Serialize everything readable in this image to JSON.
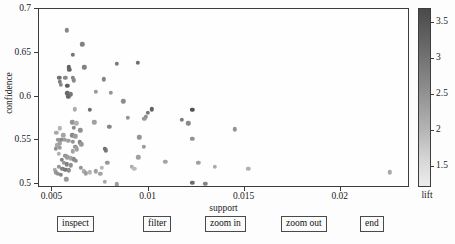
{
  "axes": {
    "x_title": "support",
    "y_title": "confidence",
    "x_ticks": [
      "0.005",
      "0.01",
      "0.015",
      "0.02"
    ],
    "x_tick_values": [
      0.005,
      0.01,
      0.015,
      0.02
    ],
    "y_ticks": [
      "0.5",
      "0.55",
      "0.6",
      "0.65",
      "0.7"
    ],
    "y_tick_values": [
      0.5,
      0.55,
      0.6,
      0.65,
      0.7
    ]
  },
  "colorbar": {
    "title": "lift",
    "ticks": [
      "3.5",
      "3",
      "2.5",
      "2",
      "1.5"
    ],
    "tick_values": [
      3.5,
      3,
      2.5,
      2,
      1.5
    ],
    "min_color": "#ececec",
    "max_color": "#4a4a4a"
  },
  "buttons": [
    {
      "label": "inspect",
      "x": 57
    },
    {
      "label": "filter",
      "x": 143
    },
    {
      "label": "zoom in",
      "x": 205
    },
    {
      "label": "zoom out",
      "x": 281
    },
    {
      "label": "end",
      "x": 360
    }
  ],
  "chart_data": {
    "type": "scatter",
    "title": "",
    "xlabel": "support",
    "ylabel": "confidence",
    "collabel": "lift",
    "xlim": [
      0.0043,
      0.0236
    ],
    "ylim": [
      0.4955,
      0.7
    ],
    "clim": [
      1.2,
      3.7
    ],
    "grid": false,
    "legend": "none",
    "marker": "circle",
    "colormap": "gray-reversed",
    "points": [
      {
        "x": 0.00575,
        "y": 0.6755,
        "lift": 2.55
      },
      {
        "x": 0.00655,
        "y": 0.6595,
        "lift": 2.6
      },
      {
        "x": 0.00605,
        "y": 0.6475,
        "lift": 2.75
      },
      {
        "x": 0.00835,
        "y": 0.6375,
        "lift": 2.7
      },
      {
        "x": 0.00945,
        "y": 0.6385,
        "lift": 2.85
      },
      {
        "x": 0.00585,
        "y": 0.6335,
        "lift": 3.0
      },
      {
        "x": 0.00587,
        "y": 0.6305,
        "lift": 2.95
      },
      {
        "x": 0.00665,
        "y": 0.6335,
        "lift": 2.6
      },
      {
        "x": 0.00535,
        "y": 0.6215,
        "lift": 2.8
      },
      {
        "x": 0.00538,
        "y": 0.6165,
        "lift": 2.65
      },
      {
        "x": 0.00545,
        "y": 0.6135,
        "lift": 2.5
      },
      {
        "x": 0.00567,
        "y": 0.6215,
        "lift": 2.5
      },
      {
        "x": 0.00605,
        "y": 0.6215,
        "lift": 2.6
      },
      {
        "x": 0.00612,
        "y": 0.6185,
        "lift": 2.5
      },
      {
        "x": 0.00578,
        "y": 0.6125,
        "lift": 3.05
      },
      {
        "x": 0.00578,
        "y": 0.6035,
        "lift": 2.9
      },
      {
        "x": 0.00595,
        "y": 0.6025,
        "lift": 2.7
      },
      {
        "x": 0.00583,
        "y": 0.5995,
        "lift": 2.9
      },
      {
        "x": 0.00767,
        "y": 0.6195,
        "lift": 2.55
      },
      {
        "x": 0.00725,
        "y": 0.6055,
        "lift": 2.3
      },
      {
        "x": 0.00805,
        "y": 0.6045,
        "lift": 2.35
      },
      {
        "x": 0.00868,
        "y": 0.5945,
        "lift": 2.45
      },
      {
        "x": 0.00617,
        "y": 0.5855,
        "lift": 2.05
      },
      {
        "x": 0.00694,
        "y": 0.5845,
        "lift": 2.85
      },
      {
        "x": 0.01018,
        "y": 0.5855,
        "lift": 3.0
      },
      {
        "x": 0.01228,
        "y": 0.5845,
        "lift": 3.2
      },
      {
        "x": 0.00995,
        "y": 0.5815,
        "lift": 2.7
      },
      {
        "x": 0.00985,
        "y": 0.5765,
        "lift": 2.45
      },
      {
        "x": 0.00893,
        "y": 0.5755,
        "lift": 2.35
      },
      {
        "x": 0.01172,
        "y": 0.5735,
        "lift": 2.65
      },
      {
        "x": 0.01207,
        "y": 0.5695,
        "lift": 2.5
      },
      {
        "x": 0.00977,
        "y": 0.5745,
        "lift": 2.3
      },
      {
        "x": 0.00604,
        "y": 0.5705,
        "lift": 2.35
      },
      {
        "x": 0.00625,
        "y": 0.5695,
        "lift": 2.0
      },
      {
        "x": 0.00718,
        "y": 0.5705,
        "lift": 2.2
      },
      {
        "x": 0.00538,
        "y": 0.5635,
        "lift": 1.95
      },
      {
        "x": 0.00612,
        "y": 0.5645,
        "lift": 2.45
      },
      {
        "x": 0.00521,
        "y": 0.5585,
        "lift": 2.1
      },
      {
        "x": 0.00795,
        "y": 0.5655,
        "lift": 2.55
      },
      {
        "x": 0.01448,
        "y": 0.5625,
        "lift": 2.35
      },
      {
        "x": 0.00556,
        "y": 0.5555,
        "lift": 2.15
      },
      {
        "x": 0.00603,
        "y": 0.5555,
        "lift": 2.5
      },
      {
        "x": 0.00618,
        "y": 0.5545,
        "lift": 2.25
      },
      {
        "x": 0.00528,
        "y": 0.5505,
        "lift": 2.3
      },
      {
        "x": 0.00546,
        "y": 0.5505,
        "lift": 2.45
      },
      {
        "x": 0.00563,
        "y": 0.5505,
        "lift": 2.25
      },
      {
        "x": 0.00582,
        "y": 0.5495,
        "lift": 2.2
      },
      {
        "x": 0.00607,
        "y": 0.5485,
        "lift": 2.35
      },
      {
        "x": 0.00643,
        "y": 0.5475,
        "lift": 2.6
      },
      {
        "x": 0.00651,
        "y": 0.5455,
        "lift": 2.3
      },
      {
        "x": 0.00525,
        "y": 0.5445,
        "lift": 2.1
      },
      {
        "x": 0.00519,
        "y": 0.5405,
        "lift": 2.4
      },
      {
        "x": 0.00538,
        "y": 0.5415,
        "lift": 2.25
      },
      {
        "x": 0.00619,
        "y": 0.5425,
        "lift": 2.3
      },
      {
        "x": 0.00628,
        "y": 0.5395,
        "lift": 2.2
      },
      {
        "x": 0.00772,
        "y": 0.5405,
        "lift": 2.9
      },
      {
        "x": 0.00778,
        "y": 0.5385,
        "lift": 2.75
      },
      {
        "x": 0.01228,
        "y": 0.5515,
        "lift": 2.4
      },
      {
        "x": 0.00952,
        "y": 0.5535,
        "lift": 2.35
      },
      {
        "x": 0.00975,
        "y": 0.5425,
        "lift": 2.3
      },
      {
        "x": 0.00605,
        "y": 0.5375,
        "lift": 2.15
      },
      {
        "x": 0.00532,
        "y": 0.5345,
        "lift": 2.0
      },
      {
        "x": 0.00567,
        "y": 0.5325,
        "lift": 2.35
      },
      {
        "x": 0.00578,
        "y": 0.5305,
        "lift": 2.25
      },
      {
        "x": 0.00596,
        "y": 0.5295,
        "lift": 2.15
      },
      {
        "x": 0.00612,
        "y": 0.5285,
        "lift": 2.5
      },
      {
        "x": 0.00623,
        "y": 0.5265,
        "lift": 2.45
      },
      {
        "x": 0.00548,
        "y": 0.5275,
        "lift": 2.55
      },
      {
        "x": 0.00558,
        "y": 0.5245,
        "lift": 2.3
      },
      {
        "x": 0.00575,
        "y": 0.5225,
        "lift": 2.6
      },
      {
        "x": 0.00594,
        "y": 0.5215,
        "lift": 2.4
      },
      {
        "x": 0.00534,
        "y": 0.5195,
        "lift": 2.35
      },
      {
        "x": 0.00552,
        "y": 0.5175,
        "lift": 2.55
      },
      {
        "x": 0.00566,
        "y": 0.5165,
        "lift": 2.7
      },
      {
        "x": 0.00584,
        "y": 0.5155,
        "lift": 2.45
      },
      {
        "x": 0.00513,
        "y": 0.5165,
        "lift": 2.05
      },
      {
        "x": 0.00516,
        "y": 0.5135,
        "lift": 2.3
      },
      {
        "x": 0.00528,
        "y": 0.5115,
        "lift": 2.4
      },
      {
        "x": 0.00545,
        "y": 0.5105,
        "lift": 2.55
      },
      {
        "x": 0.00572,
        "y": 0.5055,
        "lift": 2.3
      },
      {
        "x": 0.00664,
        "y": 0.5145,
        "lift": 2.05
      },
      {
        "x": 0.00672,
        "y": 0.5125,
        "lift": 2.25
      },
      {
        "x": 0.00693,
        "y": 0.5135,
        "lift": 1.95
      },
      {
        "x": 0.00725,
        "y": 0.5145,
        "lift": 2.2
      },
      {
        "x": 0.00748,
        "y": 0.5115,
        "lift": 2.15
      },
      {
        "x": 0.00758,
        "y": 0.5185,
        "lift": 1.9
      },
      {
        "x": 0.00786,
        "y": 0.5245,
        "lift": 2.3
      },
      {
        "x": 0.00772,
        "y": 0.5025,
        "lift": 2.1
      },
      {
        "x": 0.00836,
        "y": 0.4995,
        "lift": 2.25
      },
      {
        "x": 0.00913,
        "y": 0.5195,
        "lift": 2.05
      },
      {
        "x": 0.00925,
        "y": 0.5175,
        "lift": 1.85
      },
      {
        "x": 0.00947,
        "y": 0.5305,
        "lift": 2.2
      },
      {
        "x": 0.01087,
        "y": 0.5255,
        "lift": 2.15
      },
      {
        "x": 0.01258,
        "y": 0.5245,
        "lift": 2.2
      },
      {
        "x": 0.01345,
        "y": 0.5195,
        "lift": 2.05
      },
      {
        "x": 0.01518,
        "y": 0.5175,
        "lift": 2.0
      },
      {
        "x": 0.01228,
        "y": 0.5015,
        "lift": 2.85
      },
      {
        "x": 0.01295,
        "y": 0.5005,
        "lift": 2.55
      },
      {
        "x": 0.02255,
        "y": 0.5135,
        "lift": 2.1
      },
      {
        "x": 0.00645,
        "y": 0.5615,
        "lift": 2.4
      },
      {
        "x": 0.00537,
        "y": 0.5465,
        "lift": 2.2
      },
      {
        "x": 0.00646,
        "y": 0.5185,
        "lift": 2.35
      }
    ]
  }
}
